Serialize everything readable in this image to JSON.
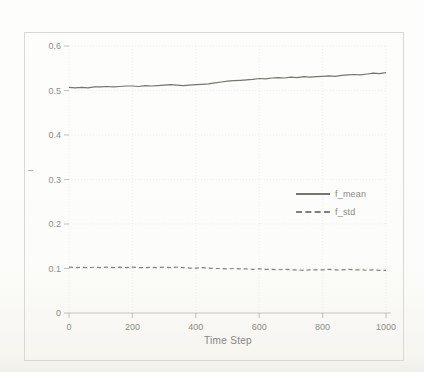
{
  "chart_data": {
    "type": "line",
    "title": "",
    "xlabel": "Time Step",
    "ylabel": "",
    "y_axis_marker": "–",
    "xlim": [
      0,
      1000
    ],
    "ylim": [
      0,
      0.6
    ],
    "x_ticks": [
      0,
      200,
      400,
      600,
      800,
      1000
    ],
    "y_ticks": [
      0,
      0.1,
      0.2,
      0.3,
      0.4,
      0.5,
      0.6
    ],
    "grid": true,
    "legend_position": "center-right",
    "x": [
      0,
      20,
      40,
      60,
      80,
      100,
      120,
      140,
      160,
      180,
      200,
      220,
      240,
      260,
      280,
      300,
      320,
      340,
      360,
      380,
      400,
      420,
      440,
      460,
      480,
      500,
      520,
      540,
      560,
      580,
      600,
      620,
      640,
      660,
      680,
      700,
      720,
      740,
      760,
      780,
      800,
      820,
      840,
      860,
      880,
      900,
      920,
      940,
      960,
      980,
      1000
    ],
    "series": [
      {
        "name": "f_mean",
        "style": "solid",
        "color": "#76766f",
        "values": [
          0.507,
          0.506,
          0.507,
          0.506,
          0.508,
          0.508,
          0.509,
          0.508,
          0.509,
          0.51,
          0.51,
          0.509,
          0.511,
          0.51,
          0.511,
          0.512,
          0.513,
          0.512,
          0.511,
          0.512,
          0.513,
          0.514,
          0.515,
          0.517,
          0.519,
          0.521,
          0.522,
          0.523,
          0.524,
          0.525,
          0.527,
          0.526,
          0.528,
          0.529,
          0.528,
          0.53,
          0.529,
          0.531,
          0.53,
          0.531,
          0.532,
          0.533,
          0.532,
          0.534,
          0.535,
          0.536,
          0.535,
          0.537,
          0.539,
          0.538,
          0.54
        ]
      },
      {
        "name": "f_std",
        "style": "dashed",
        "color": "#81817b",
        "values": [
          0.103,
          0.102,
          0.103,
          0.102,
          0.103,
          0.102,
          0.103,
          0.102,
          0.103,
          0.102,
          0.103,
          0.102,
          0.102,
          0.103,
          0.102,
          0.103,
          0.102,
          0.103,
          0.102,
          0.101,
          0.101,
          0.102,
          0.101,
          0.1,
          0.1,
          0.099,
          0.1,
          0.099,
          0.099,
          0.098,
          0.099,
          0.098,
          0.098,
          0.097,
          0.098,
          0.097,
          0.097,
          0.096,
          0.097,
          0.097,
          0.097,
          0.098,
          0.097,
          0.097,
          0.098,
          0.097,
          0.097,
          0.096,
          0.097,
          0.096,
          0.096
        ]
      }
    ],
    "colors": {
      "grid": "#e9e9e4",
      "axis": "#c6c5bf",
      "tick": "#b3b2ac",
      "tick_label": "#8d8d87",
      "figure_border": "#d9d8d2",
      "paper": "#fcfcfa"
    }
  }
}
